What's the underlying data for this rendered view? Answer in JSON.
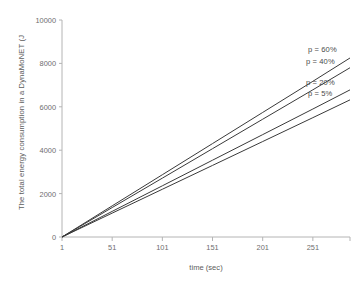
{
  "chart_data": {
    "type": "line",
    "title": "",
    "subtitle": "",
    "xlabel": "time (sec)",
    "ylabel": "The total energy consumption in a DynaMoNET (J",
    "xlim": [
      1,
      288
    ],
    "ylim": [
      0,
      10000
    ],
    "xticks": [
      1,
      51,
      101,
      151,
      201,
      251
    ],
    "yticks": [
      0,
      2000,
      4000,
      6000,
      8000,
      10000
    ],
    "xtick_labels": [
      "1",
      "51",
      "101",
      "151",
      "201",
      "251"
    ],
    "ytick_labels": [
      "0",
      "2000",
      "4000",
      "6000",
      "8000",
      "10000"
    ],
    "grid": false,
    "legend_position": "inline-right-annotations",
    "line_color": "#3a3a3a",
    "axis_color": "#b4b4b4",
    "series": [
      {
        "name": "p = 60%",
        "label": "p = 60%",
        "x": [
          1,
          51,
          101,
          151,
          201,
          251,
          288
        ],
        "values": [
          0,
          1435,
          2870,
          4305,
          5740,
          7175,
          8250
        ]
      },
      {
        "name": "p = 40%",
        "label": "p = 40%",
        "x": [
          1,
          51,
          101,
          151,
          201,
          251,
          288
        ],
        "values": [
          0,
          1357,
          2713,
          4070,
          5427,
          6783,
          7800
        ]
      },
      {
        "name": "p = 20%",
        "label": "p = 20%",
        "x": [
          1,
          51,
          101,
          151,
          201,
          251,
          288
        ],
        "values": [
          0,
          1180,
          2359,
          3539,
          4718,
          5898,
          6780
        ]
      },
      {
        "name": "p = 5%",
        "label": "p = 5%",
        "x": [
          1,
          51,
          101,
          151,
          201,
          251,
          288
        ],
        "values": [
          0,
          1100,
          2200,
          3299,
          4399,
          5499,
          6320
        ]
      }
    ],
    "annotations": [
      {
        "text": "p = 60%",
        "series": "p = 60%"
      },
      {
        "text": "p = 40%",
        "series": "p = 40%"
      },
      {
        "text": "p = 20%",
        "series": "p = 20%"
      },
      {
        "text": "p = 5%",
        "series": "p = 5%"
      }
    ]
  }
}
